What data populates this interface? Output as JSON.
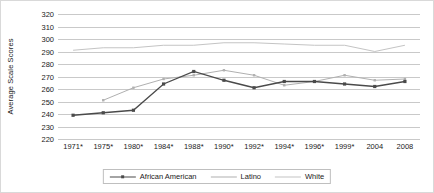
{
  "chart_data": {
    "type": "line",
    "title": "",
    "xlabel": "",
    "ylabel": "Average Scale Scores",
    "ylim": [
      220,
      320
    ],
    "ystep": 10,
    "grid": true,
    "legend_position": "bottom",
    "categories": [
      "1971*",
      "1975*",
      "1980*",
      "1984*",
      "1988*",
      "1990*",
      "1992*",
      "1994*",
      "1996*",
      "1999*",
      "2004",
      "2008"
    ],
    "ytick_labels": [
      "320",
      "310",
      "300",
      "290",
      "280",
      "270",
      "260",
      "250",
      "240",
      "230",
      "220"
    ],
    "series": [
      {
        "name": "African American",
        "color": "#4a4a4a",
        "markers": true,
        "values": [
          239,
          241,
          243,
          264,
          274,
          267,
          261,
          266,
          266,
          264,
          262,
          266
        ]
      },
      {
        "name": "Latino",
        "color": "#b0b0b0",
        "markers": true,
        "values": [
          null,
          251,
          261,
          268,
          271,
          275,
          271,
          263,
          266,
          271,
          267,
          268
        ]
      },
      {
        "name": "White",
        "color": "#c4c4c4",
        "markers": false,
        "values": [
          291,
          293,
          293,
          295,
          295,
          297,
          297,
          296,
          295,
          295,
          290,
          295
        ]
      }
    ]
  },
  "legend": {
    "items": [
      {
        "label": "African American"
      },
      {
        "label": "Latino"
      },
      {
        "label": "White"
      }
    ]
  },
  "colors": {
    "african_american": "#4a4a4a",
    "latino": "#b0b0b0",
    "white": "#c4c4c4",
    "gridline": "#c9c9c9",
    "text": "#1a1a1a",
    "border": "#d9d9d9"
  }
}
